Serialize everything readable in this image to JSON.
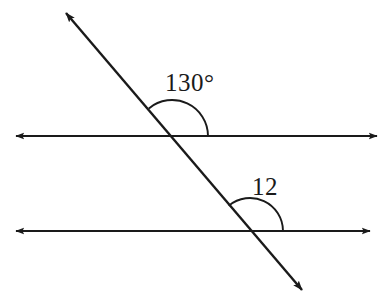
{
  "figure": {
    "kind": "geometry-diagram",
    "width": 388,
    "height": 306,
    "background_color": "#ffffff",
    "stroke_color": "#1a1a1a",
    "stroke_width": 2.2,
    "arc_stroke_width": 1.9
  },
  "labels": {
    "upper_angle": "130°",
    "lower_angle": "12"
  },
  "lines": {
    "upper_parallel": {
      "name": "upper-parallel-line",
      "x1": 10,
      "y1": 136,
      "x2": 383,
      "y2": 136,
      "arrow_start": true,
      "arrow_end": true
    },
    "lower_parallel": {
      "name": "lower-parallel-line",
      "x1": 10,
      "y1": 231,
      "x2": 376,
      "y2": 231,
      "arrow_start": true,
      "arrow_end": true
    },
    "transversal": {
      "name": "transversal-line",
      "x1": 60,
      "y1": 6,
      "x2": 308,
      "y2": 297,
      "arrow_start": true,
      "arrow_end": true
    }
  },
  "intersections": {
    "upper": {
      "x": 172,
      "y": 136
    },
    "lower": {
      "x": 250,
      "y": 231
    }
  },
  "arcs": {
    "upper_angle_arc": {
      "name": "upper-angle-arc",
      "center_x": 172,
      "center_y": 136,
      "radius": 36,
      "start_angle_deg": 0,
      "end_angle_deg": 130
    },
    "lower_angle_arc": {
      "name": "lower-angle-arc",
      "center_x": 250,
      "center_y": 231,
      "radius": 33,
      "start_angle_deg": 0,
      "end_angle_deg": 130
    }
  }
}
